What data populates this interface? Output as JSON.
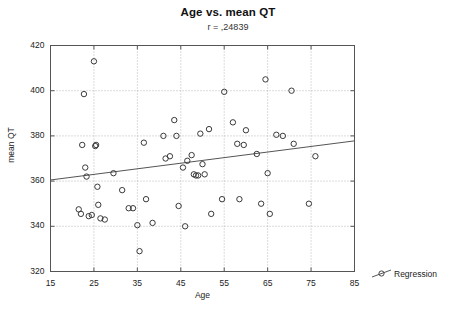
{
  "chart_data": {
    "type": "scatter",
    "title": "Age vs. mean QT",
    "subtitle": "r = ,24839",
    "correlation": ",24839",
    "xlabel": "Age",
    "ylabel": "mean QT",
    "xlim": [
      15,
      85
    ],
    "ylim": [
      320,
      420
    ],
    "xticks": [
      15,
      25,
      35,
      45,
      55,
      65,
      75,
      85
    ],
    "yticks": [
      320,
      340,
      360,
      380,
      400,
      420
    ],
    "grid": true,
    "legend_position": "bottom-right",
    "series": [
      {
        "name": "Regression",
        "type": "line",
        "marker": "open-circle",
        "x": [
          15,
          85
        ],
        "y": [
          360.5,
          377.8
        ]
      },
      {
        "name": "data",
        "type": "scatter",
        "marker": "open-circle",
        "points": [
          [
            21.5,
            347.5
          ],
          [
            22.0,
            345.5
          ],
          [
            22.3,
            376.0
          ],
          [
            22.7,
            398.5
          ],
          [
            23.0,
            366.0
          ],
          [
            23.3,
            362.0
          ],
          [
            23.8,
            344.5
          ],
          [
            24.5,
            345.0
          ],
          [
            25.0,
            413.0
          ],
          [
            25.3,
            375.5
          ],
          [
            25.5,
            376.0
          ],
          [
            25.8,
            357.5
          ],
          [
            26.0,
            349.5
          ],
          [
            26.5,
            343.5
          ],
          [
            27.5,
            343.0
          ],
          [
            29.5,
            363.5
          ],
          [
            31.5,
            356.0
          ],
          [
            33.0,
            348.0
          ],
          [
            34.0,
            348.0
          ],
          [
            35.0,
            340.5
          ],
          [
            35.5,
            329.0
          ],
          [
            36.5,
            377.0
          ],
          [
            37.0,
            352.0
          ],
          [
            38.5,
            341.5
          ],
          [
            41.0,
            380.0
          ],
          [
            41.5,
            370.0
          ],
          [
            42.5,
            371.0
          ],
          [
            43.5,
            387.0
          ],
          [
            44.0,
            380.0
          ],
          [
            44.5,
            349.0
          ],
          [
            45.5,
            366.0
          ],
          [
            46.0,
            340.0
          ],
          [
            46.5,
            369.0
          ],
          [
            47.5,
            371.5
          ],
          [
            48.0,
            363.0
          ],
          [
            48.5,
            362.5
          ],
          [
            49.0,
            362.5
          ],
          [
            49.5,
            381.0
          ],
          [
            50.0,
            367.5
          ],
          [
            50.5,
            363.0
          ],
          [
            51.5,
            383.0
          ],
          [
            52.0,
            345.5
          ],
          [
            54.5,
            352.0
          ],
          [
            55.0,
            399.5
          ],
          [
            57.0,
            386.0
          ],
          [
            58.0,
            376.5
          ],
          [
            58.5,
            352.0
          ],
          [
            59.5,
            376.0
          ],
          [
            60.0,
            382.5
          ],
          [
            62.5,
            372.0
          ],
          [
            63.5,
            350.0
          ],
          [
            64.5,
            405.0
          ],
          [
            65.0,
            363.5
          ],
          [
            65.5,
            345.5
          ],
          [
            67.0,
            380.5
          ],
          [
            68.5,
            380.0
          ],
          [
            70.5,
            400.0
          ],
          [
            71.0,
            376.5
          ],
          [
            74.5,
            350.0
          ],
          [
            76.0,
            371.0
          ]
        ]
      }
    ]
  },
  "legend": {
    "label": "Regression"
  }
}
